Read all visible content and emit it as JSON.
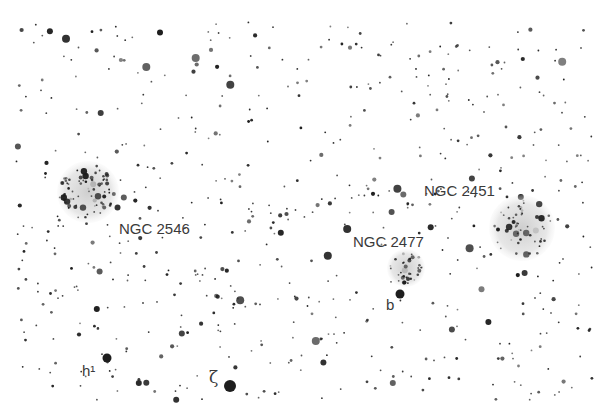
{
  "map": {
    "type": "star-chart",
    "clusters": [
      {
        "id": "ngc2546",
        "label": "NGC 2546",
        "name_tag": "cluster-ngc-2546"
      },
      {
        "id": "ngc2477",
        "label": "NGC 2477",
        "name_tag": "cluster-ngc-2477"
      },
      {
        "id": "ngc2451",
        "label": "NGC 2451",
        "name_tag": "cluster-ngc-2451"
      }
    ],
    "stars": [
      {
        "id": "b",
        "label": "b"
      },
      {
        "id": "h",
        "label": "h¹"
      },
      {
        "id": "zeta",
        "label": "ζ"
      }
    ],
    "colors": {
      "star": "#1e1e1e",
      "cluster_fill": "#d8d8d8",
      "label": "#3a3a3a",
      "background": "#ffffff"
    }
  }
}
